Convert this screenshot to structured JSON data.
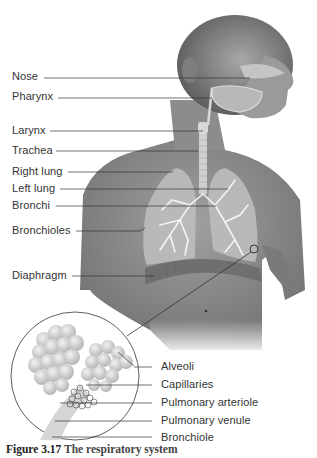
{
  "figure": {
    "left_labels": [
      {
        "text": "Nose",
        "y": 76
      },
      {
        "text": "Pharynx",
        "y": 96
      },
      {
        "text": "Larynx",
        "y": 130
      },
      {
        "text": "Trachea",
        "y": 150
      },
      {
        "text": "Right lung",
        "y": 171
      },
      {
        "text": "Left lung",
        "y": 188
      },
      {
        "text": "Bronchi",
        "y": 205
      },
      {
        "text": "Bronchioles",
        "y": 230
      },
      {
        "text": "Diaphragm",
        "y": 275
      }
    ],
    "right_labels": [
      {
        "text": "Alveoli",
        "y": 366
      },
      {
        "text": "Capillaries",
        "y": 384
      },
      {
        "text": "Pulmonary arteriole",
        "y": 402
      },
      {
        "text": "Pulmonary venule",
        "y": 420
      },
      {
        "text": "Bronchiole",
        "y": 437
      }
    ],
    "caption": {
      "number": "Figure 3.17",
      "text": "The respiratory system"
    },
    "colors": {
      "skin": "#8a8a8a",
      "lung": "#c8c8c8",
      "leader_line": "#333333",
      "label_text": "#333333"
    }
  }
}
